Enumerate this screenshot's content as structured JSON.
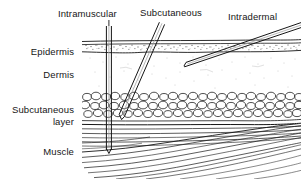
{
  "figure": {
    "background_color": "#ffffff",
    "ink_color": "#161616"
  },
  "layer_labels": [
    {
      "id": "epidermis",
      "text": "Epidermis",
      "x": 74,
      "y": 55,
      "anchor": "end"
    },
    {
      "id": "dermis",
      "text": "Dermis",
      "x": 74,
      "y": 78,
      "anchor": "end"
    },
    {
      "id": "subcutaneous-layer-line1",
      "text": "Subcutaneous",
      "x": 74,
      "y": 113,
      "anchor": "end"
    },
    {
      "id": "subcutaneous-layer-line2",
      "text": "layer",
      "x": 74,
      "y": 125,
      "anchor": "end"
    },
    {
      "id": "muscle",
      "text": "Muscle",
      "x": 74,
      "y": 155,
      "anchor": "end"
    }
  ],
  "route_labels": [
    {
      "id": "intramuscular",
      "text": "Intramuscular",
      "x": 58,
      "y": 17,
      "anchor": "start"
    },
    {
      "id": "subcutaneous",
      "text": "Subcutaneous",
      "x": 140,
      "y": 16,
      "anchor": "start"
    },
    {
      "id": "intradermal",
      "text": "Intradermal",
      "x": 228,
      "y": 20,
      "anchor": "start"
    }
  ],
  "needles": [
    {
      "id": "intramuscular-needle",
      "route": "Intramuscular",
      "angle_degrees": 90,
      "entry": {
        "x": 109,
        "y": 26
      },
      "tip": {
        "x": 109,
        "y": 152
      },
      "terminates_in": "Muscle"
    },
    {
      "id": "subcutaneous-needle",
      "route": "Subcutaneous",
      "angle_degrees": 45,
      "entry": {
        "x": 162,
        "y": 25
      },
      "tip": {
        "x": 122,
        "y": 118
      },
      "terminates_in": "Subcutaneous layer"
    },
    {
      "id": "intradermal-needle",
      "route": "Intradermal",
      "angle_degrees": 15,
      "entry": {
        "x": 290,
        "y": 26
      },
      "tip": {
        "x": 185,
        "y": 65
      },
      "terminates_in": "Dermis"
    }
  ],
  "tissue_bands": {
    "skin_surface_y": 41,
    "epidermis": {
      "top": 43,
      "bottom": 52
    },
    "dermis": {
      "top": 52,
      "bottom": 92
    },
    "subcutaneous": {
      "top": 92,
      "bottom": 124
    },
    "muscle": {
      "top": 124,
      "bottom": 178
    },
    "block_left": 82,
    "block_right": 301
  }
}
